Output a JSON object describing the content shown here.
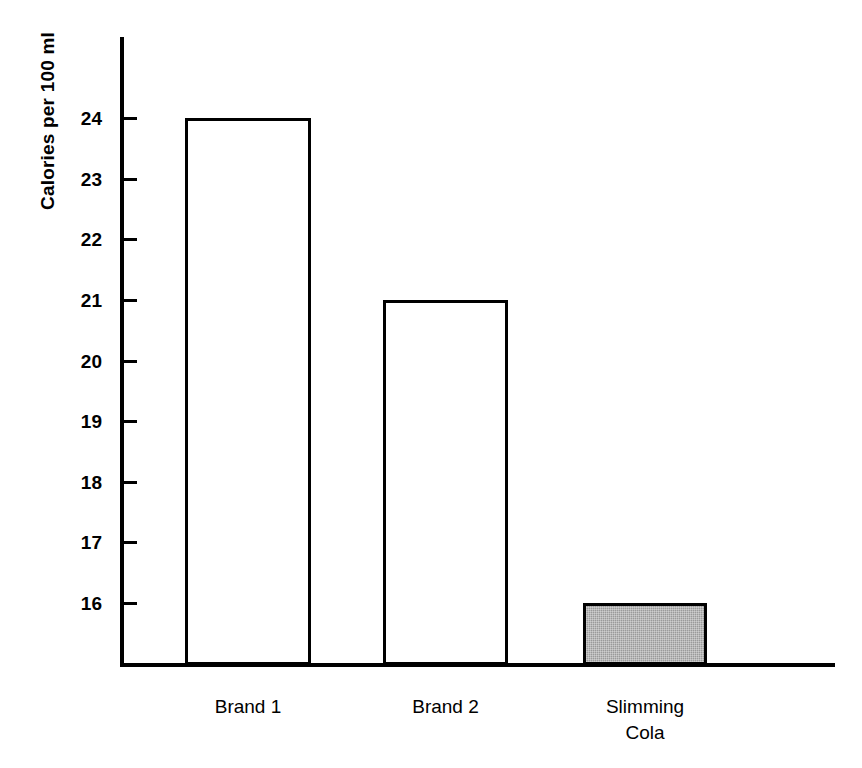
{
  "chart_data": {
    "type": "bar",
    "title": "",
    "subtitle": "",
    "xlabel": "",
    "ylabel": "Calories per 100 ml",
    "categories": [
      "Brand 1",
      "Brand 2",
      "Slimming\nCola"
    ],
    "values": [
      24,
      21,
      16
    ],
    "ylim": [
      15.4,
      24.8
    ],
    "yticks": [
      16,
      17,
      18,
      19,
      20,
      21,
      22,
      23,
      24
    ],
    "ytick_labels": [
      "16",
      "17",
      "18",
      "19",
      "20",
      "21",
      "22",
      "23",
      "24"
    ],
    "grid": false,
    "legend": null,
    "series": [
      {
        "name": "Calories per 100 ml",
        "values": [
          24,
          21,
          16
        ]
      }
    ],
    "bars": [
      {
        "category": "Brand 1",
        "label": "Brand 1",
        "value": 24,
        "fill": "white",
        "edge_color": "#000000"
      },
      {
        "category": "Brand 2",
        "label": "Brand 2",
        "value": 21,
        "fill": "white",
        "edge_color": "#000000"
      },
      {
        "category": "Slimming Cola",
        "label": "Slimming\nCola",
        "value": 16,
        "fill": "grey",
        "edge_color": "#000000"
      }
    ],
    "colors": {
      "axis": "#000000",
      "bar_edge": "#000000",
      "bar_fill_open": "#ffffff",
      "bar_fill_shaded": "#9a9a9a",
      "background": "#ffffff",
      "text": "#000000"
    }
  }
}
